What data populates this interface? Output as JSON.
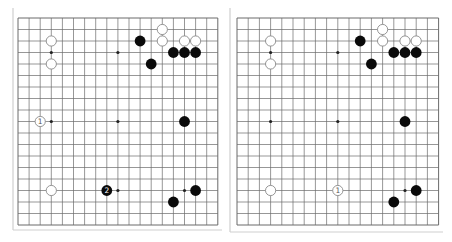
{
  "boards": [
    {
      "id": "left",
      "origin": {
        "x": 18,
        "y": 18
      },
      "spacing": {
        "x": 11.1,
        "y": 11.5
      },
      "frame": {
        "left_x": 13,
        "bottom_y": 230,
        "top_y": 8,
        "right_x": 222
      },
      "size": 19,
      "star_points": [
        [
          3,
          3
        ],
        [
          9,
          3
        ],
        [
          15,
          3
        ],
        [
          3,
          9
        ],
        [
          9,
          9
        ],
        [
          15,
          9
        ],
        [
          3,
          15
        ],
        [
          9,
          15
        ],
        [
          15,
          15
        ]
      ],
      "stones": [
        {
          "color": "white",
          "col": 3,
          "row": 2
        },
        {
          "color": "white",
          "col": 3,
          "row": 4
        },
        {
          "color": "black",
          "col": 11,
          "row": 2
        },
        {
          "color": "white",
          "col": 13,
          "row": 1
        },
        {
          "color": "white",
          "col": 13,
          "row": 2
        },
        {
          "color": "white",
          "col": 15,
          "row": 2
        },
        {
          "color": "white",
          "col": 16,
          "row": 2
        },
        {
          "color": "black",
          "col": 14,
          "row": 3
        },
        {
          "color": "black",
          "col": 15,
          "row": 3
        },
        {
          "color": "black",
          "col": 16,
          "row": 3
        },
        {
          "color": "black",
          "col": 12,
          "row": 4
        },
        {
          "color": "white",
          "col": 2,
          "row": 9,
          "label": "1"
        },
        {
          "color": "black",
          "col": 15,
          "row": 9
        },
        {
          "color": "white",
          "col": 3,
          "row": 15
        },
        {
          "color": "black",
          "col": 8,
          "row": 15,
          "label": "2"
        },
        {
          "color": "black",
          "col": 16,
          "row": 15
        },
        {
          "color": "black",
          "col": 14,
          "row": 16
        }
      ]
    },
    {
      "id": "right",
      "origin": {
        "x": 237,
        "y": 18
      },
      "spacing": {
        "x": 11.2,
        "y": 11.5
      },
      "frame": {
        "left_x": 230,
        "bottom_y": 232,
        "top_y": 8,
        "right_x": 443
      },
      "size": 19,
      "star_points": [
        [
          3,
          3
        ],
        [
          9,
          3
        ],
        [
          15,
          3
        ],
        [
          3,
          9
        ],
        [
          9,
          9
        ],
        [
          15,
          9
        ],
        [
          3,
          15
        ],
        [
          9,
          15
        ],
        [
          15,
          15
        ]
      ],
      "stones": [
        {
          "color": "white",
          "col": 3,
          "row": 2
        },
        {
          "color": "white",
          "col": 3,
          "row": 4
        },
        {
          "color": "black",
          "col": 11,
          "row": 2
        },
        {
          "color": "white",
          "col": 13,
          "row": 1
        },
        {
          "color": "white",
          "col": 13,
          "row": 2
        },
        {
          "color": "white",
          "col": 15,
          "row": 2
        },
        {
          "color": "white",
          "col": 16,
          "row": 2
        },
        {
          "color": "black",
          "col": 14,
          "row": 3
        },
        {
          "color": "black",
          "col": 15,
          "row": 3
        },
        {
          "color": "black",
          "col": 16,
          "row": 3
        },
        {
          "color": "black",
          "col": 12,
          "row": 4
        },
        {
          "color": "black",
          "col": 15,
          "row": 9
        },
        {
          "color": "white",
          "col": 3,
          "row": 15
        },
        {
          "color": "white",
          "col": 9,
          "row": 15,
          "label": "1"
        },
        {
          "color": "black",
          "col": 16,
          "row": 15
        },
        {
          "color": "black",
          "col": 14,
          "row": 16
        }
      ]
    }
  ],
  "colors": {
    "grid": "#6a6a6a",
    "frame": "#cfcfcf",
    "black_stone": "#0a0a0a",
    "white_stone_fill": "#ffffff",
    "white_stone_stroke": "#8a8a8a",
    "star": "#222222",
    "label_on_black": "#ffffff",
    "label_on_white": "#555555"
  }
}
